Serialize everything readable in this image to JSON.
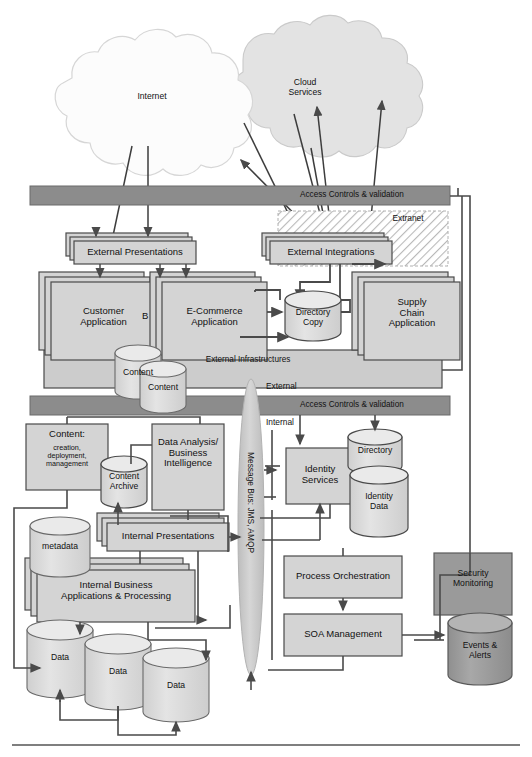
{
  "diagram": {
    "type": "architecture-diagram",
    "colors": {
      "box_fill": "#d4d4d4",
      "box_stroke": "#4a4a4a",
      "band_fill": "#c9c9c9",
      "access_bar_fill": "#8c8c8c",
      "dark_fill": "#9a9a9a",
      "cylinder_fill": "#d8d8d8",
      "cylinder_top": "#e6e6e6",
      "cloud_internet": "#fbfbfb",
      "cloud_services": "#e3e3e3",
      "extranet_hatch": "#bdbdbd",
      "line": "#4a4a4a",
      "page_rule": "#555555"
    }
  },
  "clouds": [
    {
      "id": "internet",
      "label": "Internet"
    },
    {
      "id": "cloud-services",
      "label": "Cloud\nServices"
    }
  ],
  "access_bars": [
    {
      "id": "external-access",
      "label": "Access Controls & validation"
    },
    {
      "id": "internal-access",
      "label": "Access Controls & validation"
    }
  ],
  "zones": [
    {
      "id": "extranet",
      "label": "Extranet"
    },
    {
      "id": "external",
      "label": "External"
    },
    {
      "id": "internal",
      "label": "Internal"
    }
  ],
  "bands": [
    {
      "id": "external-infrastructures",
      "label": "External Infrastructures"
    }
  ],
  "message_bus": {
    "id": "message-bus",
    "label": "Message Bus: JMS, AMQP"
  },
  "boxes": [
    {
      "id": "external-presentations",
      "label": "External Presentations",
      "stacked": true
    },
    {
      "id": "external-integrations",
      "label": "External Integrations",
      "stacked": true
    },
    {
      "id": "customer-application",
      "label": "Customer\nApplication",
      "stacked": true
    },
    {
      "id": "hidden-b-application",
      "label": "B",
      "stacked": true
    },
    {
      "id": "ecommerce-application",
      "label": "E-Commerce\nApplication",
      "stacked": true
    },
    {
      "id": "supply-chain-application",
      "label": "Supply\nChain\nApplication",
      "stacked": true
    },
    {
      "id": "content-management",
      "label": "Content:",
      "sublabel": "creation,\ndeployment,\nmanagement"
    },
    {
      "id": "data-analysis-bi",
      "label": "Data Analysis/\nBusiness\nIntelligence"
    },
    {
      "id": "internal-presentations",
      "label": "Internal Presentations",
      "stacked": true
    },
    {
      "id": "internal-business-applications",
      "label": "Internal Business\nApplications & Processing",
      "stacked": true
    },
    {
      "id": "identity-services",
      "label": "Identity\nServices"
    },
    {
      "id": "process-orchestration",
      "label": "Process Orchestration"
    },
    {
      "id": "soa-management",
      "label": "SOA Management"
    },
    {
      "id": "security-monitoring",
      "label": "Security\nMonitoring",
      "dark": true
    }
  ],
  "cylinders": [
    {
      "id": "directory-copy",
      "label": "Directory\nCopy"
    },
    {
      "id": "content-store-1",
      "label": "Content"
    },
    {
      "id": "content-store-2",
      "label": "Content"
    },
    {
      "id": "content-archive",
      "label": "Content\nArchive"
    },
    {
      "id": "metadata-store",
      "label": "metadata"
    },
    {
      "id": "directory",
      "label": "Directory"
    },
    {
      "id": "identity-data",
      "label": "Identity\nData"
    },
    {
      "id": "data-store-1",
      "label": "Data"
    },
    {
      "id": "data-store-2",
      "label": "Data"
    },
    {
      "id": "data-store-3",
      "label": "Data"
    },
    {
      "id": "events-alerts",
      "label": "Events &\nAlerts",
      "dark": true
    }
  ]
}
